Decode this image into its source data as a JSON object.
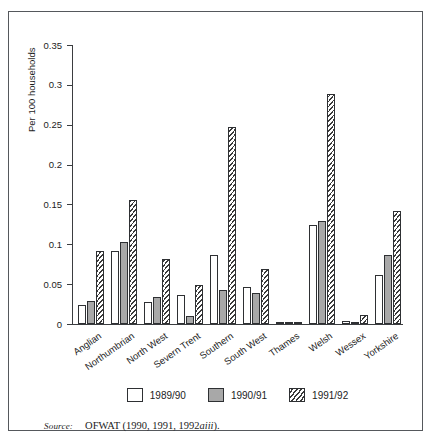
{
  "chart_data": {
    "type": "bar",
    "title": "",
    "xlabel": "",
    "ylabel": "Per 100 households",
    "ylim": [
      0,
      0.35
    ],
    "yticks": [
      "0",
      "0.05",
      "0.1",
      "0.15",
      "0.2",
      "0.25",
      "0.3",
      "0.35"
    ],
    "ytick_values": [
      0,
      0.05,
      0.1,
      0.15,
      0.2,
      0.25,
      0.3,
      0.35
    ],
    "grid": false,
    "legend_position": "bottom-center",
    "categories": [
      "Anglian",
      "Northumbrian",
      "North West",
      "Severn Trent",
      "Southern",
      "South West",
      "Thames",
      "Welsh",
      "Wessex",
      "Yorkshire"
    ],
    "series": [
      {
        "name": "1989/90",
        "fill": "solid-white",
        "color": "#ffffff",
        "values": [
          0.024,
          0.091,
          0.028,
          0.037,
          0.087,
          0.046,
          0.001,
          0.124,
          0.004,
          0.062
        ]
      },
      {
        "name": "1990/91",
        "fill": "solid-gray",
        "color": "#a8a8a8",
        "values": [
          0.029,
          0.103,
          0.034,
          0.01,
          0.043,
          0.039,
          0.0,
          0.129,
          0.0,
          0.087
        ]
      },
      {
        "name": "1991/92",
        "fill": "diagonal-hatch",
        "color": "#3a3a3a",
        "values": [
          0.092,
          0.155,
          0.081,
          0.049,
          0.247,
          0.069,
          0.002,
          0.288,
          0.011,
          0.142
        ]
      }
    ]
  },
  "legend": {
    "items": [
      {
        "label": "1989/90"
      },
      {
        "label": "1990/91"
      },
      {
        "label": "1991/92"
      }
    ]
  },
  "source": {
    "prefix": "Source:",
    "text": "OFWAT (1990, 1991, 1992",
    "text_italic": "aiii",
    "text_suffix": ")."
  }
}
